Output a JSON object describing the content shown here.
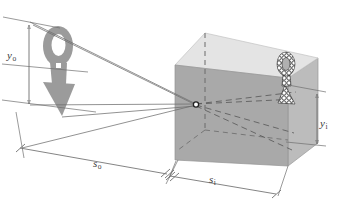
{
  "figure": {
    "type": "optics-ray-diagram",
    "background_color": "#ffffff",
    "labels": {
      "object_height": {
        "symbol": "y",
        "subscript": "o",
        "text": "yo"
      },
      "image_height": {
        "symbol": "y",
        "subscript": "i",
        "text": "yi"
      },
      "object_distance": {
        "symbol": "s",
        "subscript": "o",
        "text": "so"
      },
      "image_distance": {
        "symbol": "s",
        "subscript": "i",
        "text": "si"
      }
    },
    "colors": {
      "box_front_face": "#a9a9a9",
      "box_top_face": "#e3e3e3",
      "box_right_face": "#bdbdbd",
      "object_arrow": "#9b9b9b",
      "ray_line": "#6e6e6e",
      "dimension_line": "#6e6e6e",
      "dashed_hidden_edge": "#6a6a6a",
      "label_text": "#3a3a3a",
      "image_stipple": "#1a1a1a"
    },
    "object": {
      "name": "arrow-object",
      "description": "gray downward-pointing arrow with oval loop head",
      "orientation": "down",
      "fill": "#9b9b9b"
    },
    "image": {
      "name": "arrow-image",
      "description": "inverted stippled arrow with oval loop, pointing up, on back wall of box",
      "orientation": "up",
      "style": "stippled-outline"
    },
    "pinhole": {
      "name": "pinhole-aperture",
      "marker": "o",
      "x": 196,
      "y": 104
    },
    "box": {
      "name": "camera-box",
      "shape": "cuboid",
      "projection": "oblique"
    },
    "rays": {
      "count": 4,
      "description": "straight rays from object tip and tail converge at pinhole and diverge to form inverted image"
    }
  }
}
